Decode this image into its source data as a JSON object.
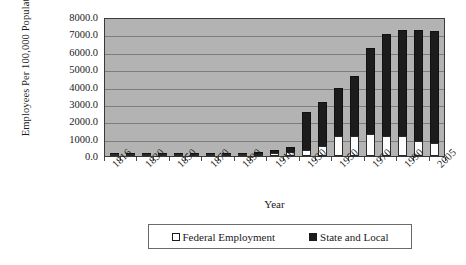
{
  "chart_data": {
    "type": "bar",
    "subtype": "stacked",
    "title": "",
    "xlabel": "Year",
    "ylabel": "Employees Per 100,000 Population",
    "ylim": [
      0,
      8000
    ],
    "ytick_step": 1000,
    "ytick_labels": [
      "8000.0",
      "7000.0",
      "6000.0",
      "5000.0",
      "4000.0",
      "3000.0",
      "2000.0",
      "1000.0",
      "0.0"
    ],
    "ytick_values": [
      8000,
      7000,
      6000,
      5000,
      4000,
      3000,
      2000,
      1000,
      0
    ],
    "grid": true,
    "legend_position": "bottom",
    "plot_bgcolor": "#b3b3b3",
    "categories": [
      "1816",
      "1821",
      "1830",
      "1841",
      "1850",
      "1861",
      "1870",
      "1881",
      "1890",
      "1901",
      "1910",
      "1921",
      "1930",
      "1941",
      "1950",
      "1961",
      "1970",
      "1981",
      "1990",
      "2000",
      "2005"
    ],
    "visible_tick_labels": [
      "1816",
      "1830",
      "1850",
      "1870",
      "1890",
      "1910",
      "1930",
      "1950",
      "1970",
      "1990",
      "2005"
    ],
    "series": [
      {
        "name": "Federal Employment",
        "color": "#ffffff",
        "values": [
          20,
          25,
          35,
          45,
          50,
          60,
          75,
          90,
          110,
          140,
          170,
          240,
          330,
          560,
          1150,
          1180,
          1280,
          1150,
          1150,
          860,
          750
        ]
      },
      {
        "name": "State and Local",
        "color": "#1c1c1c",
        "values": [
          5,
          8,
          12,
          18,
          25,
          35,
          45,
          60,
          85,
          115,
          160,
          270,
          2230,
          2560,
          2760,
          3420,
          4930,
          5880,
          6120,
          6400,
          6450
        ]
      }
    ],
    "totals": [
      25,
      33,
      47,
      63,
      75,
      95,
      120,
      150,
      195,
      255,
      330,
      510,
      2560,
      3120,
      3910,
      4600,
      6210,
      7030,
      7270,
      7260,
      7200
    ]
  },
  "legend": {
    "items": [
      {
        "label": "Federal Employment",
        "swatch": "open-square-icon"
      },
      {
        "label": "State and Local",
        "swatch": "filled-square-icon"
      }
    ]
  }
}
